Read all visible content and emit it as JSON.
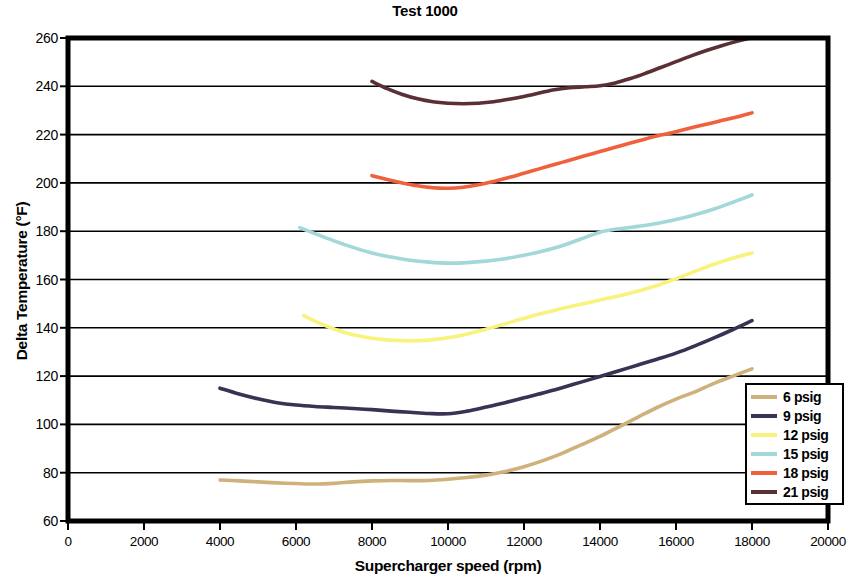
{
  "chart_data": {
    "type": "line",
    "title": "Test 1000",
    "xlabel": "Supercharger speed (rpm)",
    "ylabel": "Delta Temperature (°F)",
    "xlim": [
      0,
      20000
    ],
    "ylim": [
      60,
      260
    ],
    "xticks": [
      0,
      2000,
      4000,
      6000,
      8000,
      10000,
      12000,
      14000,
      16000,
      18000,
      20000
    ],
    "yticks": [
      60,
      80,
      100,
      120,
      140,
      160,
      180,
      200,
      220,
      240,
      260
    ],
    "xtick_labels": [
      "0",
      "2000",
      "4000",
      "6000",
      "8000",
      "10000",
      "12000",
      "14000",
      "16000",
      "18000",
      "20000"
    ],
    "ytick_labels": [
      "60",
      "80",
      "100",
      "120",
      "140",
      "160",
      "180",
      "200",
      "220",
      "240",
      "260"
    ],
    "grid": "horizontal",
    "legend_position": "bottom-right",
    "series": [
      {
        "name": "6 psig",
        "color": "#cfb17a",
        "x": [
          4000,
          4500,
          5000,
          5500,
          6000,
          6500,
          7000,
          7500,
          8000,
          8500,
          9000,
          9500,
          10000,
          10500,
          11000,
          11500,
          12000,
          12500,
          13000,
          13500,
          14000,
          14500,
          15000,
          15500,
          16000,
          16500,
          17000,
          17500,
          18000
        ],
        "y": [
          77,
          76.6,
          76.2,
          75.8,
          75.5,
          75.3,
          75.6,
          76.2,
          76.6,
          76.8,
          76.7,
          76.8,
          77.3,
          78.0,
          79.0,
          80.5,
          82.5,
          85.0,
          88.0,
          91.5,
          95.0,
          99.0,
          103.0,
          107.0,
          110.5,
          113.5,
          117.0,
          120.0,
          123.0
        ]
      },
      {
        "name": "9 psig",
        "color": "#3b3152",
        "x": [
          4000,
          4500,
          5000,
          5500,
          6000,
          6500,
          7000,
          7500,
          8000,
          8500,
          9000,
          9500,
          10000,
          10500,
          11000,
          11500,
          12000,
          12500,
          13000,
          13500,
          14000,
          14500,
          15000,
          15500,
          16000,
          16500,
          17000,
          17500,
          18000
        ],
        "y": [
          115.0,
          112.6,
          110.6,
          109.0,
          108.0,
          107.4,
          107.0,
          106.6,
          106.1,
          105.5,
          105.0,
          104.5,
          104.4,
          105.5,
          107.2,
          109.0,
          111.0,
          113.0,
          115.2,
          117.5,
          119.8,
          122.2,
          124.6,
          127.0,
          129.5,
          132.5,
          135.8,
          139.3,
          143.0
        ]
      },
      {
        "name": "12 psig",
        "color": "#f8f27e",
        "x": [
          6200,
          6600,
          7000,
          7400,
          7800,
          8200,
          8600,
          9000,
          9400,
          9800,
          10200,
          10600,
          11000,
          11400,
          11800,
          12200,
          12600,
          13000,
          13400,
          13800,
          14200,
          14600,
          15000,
          15400,
          15800,
          16200,
          16600,
          17000,
          17400,
          18000
        ],
        "y": [
          145.0,
          142.0,
          139.5,
          137.5,
          136.2,
          135.3,
          134.8,
          134.6,
          134.8,
          135.4,
          136.4,
          137.8,
          139.4,
          141.2,
          143.0,
          144.8,
          146.4,
          148.0,
          149.4,
          150.8,
          152.2,
          153.6,
          155.2,
          157.0,
          159.2,
          161.5,
          164.0,
          166.3,
          168.4,
          171.0
        ]
      },
      {
        "name": "15 psig",
        "color": "#a2d8d8",
        "x": [
          6100,
          6500,
          7000,
          7500,
          8000,
          8500,
          9000,
          9500,
          10000,
          10500,
          11000,
          11500,
          12000,
          12500,
          13000,
          13500,
          14000,
          14500,
          15000,
          15500,
          16000,
          16500,
          17000,
          17500,
          18000
        ],
        "y": [
          181.5,
          179.0,
          176.0,
          173.3,
          171.0,
          169.3,
          168.0,
          167.2,
          166.8,
          167.0,
          167.6,
          168.6,
          170.0,
          171.8,
          174.0,
          176.8,
          179.6,
          181.0,
          182.0,
          183.2,
          184.8,
          186.8,
          189.2,
          192.0,
          195.0
        ]
      },
      {
        "name": "18 psig",
        "color": "#f0603c",
        "x": [
          8000,
          8400,
          8800,
          9200,
          9600,
          10000,
          10400,
          10800,
          11200,
          11600,
          12000,
          12400,
          12800,
          13200,
          13600,
          14000,
          14400,
          14800,
          15200,
          15600,
          16000,
          16400,
          16800,
          17200,
          17600,
          18000
        ],
        "y": [
          203.0,
          201.4,
          200.0,
          198.8,
          198.0,
          197.8,
          198.2,
          199.2,
          200.6,
          202.2,
          204.0,
          205.8,
          207.6,
          209.4,
          211.2,
          213.0,
          214.8,
          216.5,
          218.2,
          219.8,
          221.2,
          222.8,
          224.3,
          225.8,
          227.3,
          229.0
        ]
      },
      {
        "name": "21 psig",
        "color": "#5a2f36",
        "x": [
          8000,
          8400,
          8800,
          9200,
          9600,
          10000,
          10400,
          10800,
          11200,
          11600,
          12000,
          12400,
          12800,
          13200,
          13600,
          14000,
          14400,
          14800,
          15200,
          15600,
          16000,
          16400,
          16800,
          17200,
          17600,
          18000
        ],
        "y": [
          242.0,
          239.0,
          236.6,
          234.8,
          233.6,
          233.0,
          232.8,
          233.0,
          233.6,
          234.6,
          235.8,
          237.2,
          238.6,
          239.4,
          239.8,
          240.2,
          241.4,
          243.2,
          245.4,
          247.8,
          250.2,
          252.6,
          254.8,
          256.8,
          258.6,
          260.2
        ]
      }
    ]
  },
  "legend": {
    "items": [
      {
        "label": "6 psig"
      },
      {
        "label": "9 psig"
      },
      {
        "label": "12 psig"
      },
      {
        "label": "15 psig"
      },
      {
        "label": "18 psig"
      },
      {
        "label": "21 psig"
      }
    ]
  }
}
